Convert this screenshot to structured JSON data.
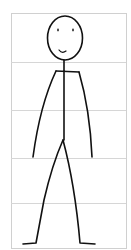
{
  "figure": {
    "frame": {
      "x": 11,
      "y": 13,
      "width": 115,
      "height": 235,
      "stroke": "#d0d0d0"
    },
    "grid_lines_y": [
      62,
      110,
      158,
      203
    ],
    "grid_color": "#d6d6d6",
    "stroke_color": "#111111",
    "head": {
      "cx": 65,
      "cy": 38,
      "rx": 17.5,
      "ry": 22
    },
    "eyes": [
      {
        "cx": 58,
        "cy": 30
      },
      {
        "cx": 73,
        "cy": 30
      }
    ],
    "smile": "M59,50 Q62,54 66,51",
    "neck": "M64,60 L64,71",
    "shoulders": "M56,71 L79,72",
    "spine": "M64,71 L64,140",
    "left_arm": "M56,71 Q40,105 33,157",
    "right_arm": "M79,72 Q90,110 92,157",
    "left_leg": "M63,140 Q52,165 44,200 L36,243 L23,244",
    "right_leg": "M63,140 Q75,185 80,243 L95,244"
  }
}
